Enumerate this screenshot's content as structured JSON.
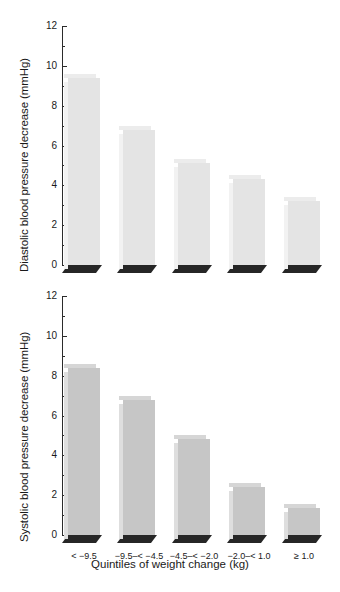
{
  "chart_data": [
    {
      "id": "diastolic",
      "type": "bar",
      "title": "",
      "xlabel": "",
      "ylabel": "Diastolic blood pressure decrease (mmHg)",
      "categories": [
        "< −9.5",
        "−9.5–< −4.5",
        "−4.5–< −2.0",
        "−2.0–< 1.0",
        "≥ 1.0"
      ],
      "values": [
        9.4,
        6.8,
        5.1,
        4.3,
        3.2
      ],
      "ylim": [
        0,
        12
      ],
      "ytick_labels": [
        "0",
        "2",
        "4",
        "6",
        "8",
        "10",
        "12"
      ],
      "ytick_values": [
        0,
        2,
        4,
        6,
        8,
        10,
        12
      ],
      "yminor_values": [
        1,
        3,
        5,
        7,
        9,
        11
      ],
      "grid": false,
      "legend": "none",
      "bar_color": "#e4e4e4",
      "base_color": "#262626"
    },
    {
      "id": "systolic",
      "type": "bar",
      "title": "",
      "xlabel": "Quintiles of weight change (kg)",
      "ylabel": "Systolic blood pressure decrease (mmHg)",
      "categories": [
        "< −9.5",
        "−9.5–< −4.5",
        "−4.5–< −2.0",
        "−2.0–< 1.0",
        "≥ 1.0"
      ],
      "values": [
        8.4,
        6.8,
        4.8,
        2.4,
        1.35
      ],
      "ylim": [
        0,
        12
      ],
      "ytick_labels": [
        "0",
        "2",
        "4",
        "6",
        "8",
        "10",
        "12"
      ],
      "ytick_values": [
        0,
        2,
        4,
        6,
        8,
        10,
        12
      ],
      "yminor_values": [
        1,
        3,
        5,
        7,
        9,
        11
      ],
      "grid": false,
      "legend": "none",
      "bar_color": "#c6c6c6",
      "base_color": "#262626"
    }
  ]
}
